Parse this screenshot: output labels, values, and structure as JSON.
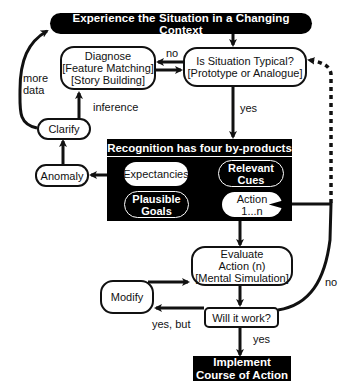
{
  "diagram": {
    "nodes": {
      "experience": "Experience the Situation in a Changing Context",
      "diagnose": [
        "Diagnose",
        "[Feature Matching]",
        "[Story Building]"
      ],
      "typical": [
        "Is Situation Typical?",
        "[Prototype or Analogue]"
      ],
      "clarify": "Clarify",
      "anomaly": "Anomaly",
      "recognition_header": "Recognition has four by-products",
      "expectancies": "Expectancies",
      "relevant_cues": [
        "Relevant",
        "Cues"
      ],
      "plausible_goals": [
        "Plausible",
        "Goals"
      ],
      "action": [
        "Action",
        "1...n"
      ],
      "evaluate": [
        "Evaluate",
        "Action (n)",
        "[Mental Simulation]"
      ],
      "modify": "Modify",
      "will_it_work": "Will it work?",
      "implement": [
        "Implement",
        "Course of Action"
      ]
    },
    "edge_labels": {
      "no_typical": "no",
      "more_data": [
        "more",
        "data"
      ],
      "inference": "inference",
      "yes_typical": "yes",
      "no_work": "no",
      "yes_but": "yes, but",
      "yes_work": "yes"
    },
    "colors": {
      "ink": "#111111",
      "background": "#ffffff",
      "dark_fill": "#000000"
    }
  }
}
